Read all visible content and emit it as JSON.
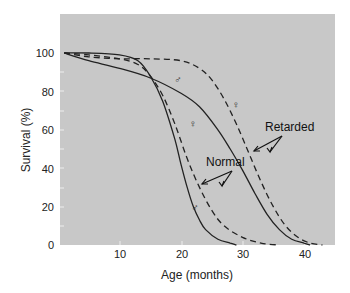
{
  "chart_data": {
    "type": "line",
    "title": "",
    "xlabel": "Age (months)",
    "ylabel": "Survival (%)",
    "xlim": [
      0,
      45
    ],
    "ylim": [
      0,
      120
    ],
    "xticks": [
      10,
      20,
      30,
      40
    ],
    "yticks": [
      0,
      20,
      40,
      60,
      80,
      100
    ],
    "grid": false,
    "background": "#c8c8c8",
    "series": [
      {
        "name": "Normal ♂",
        "group": "Normal",
        "sex": "male",
        "style": "solid",
        "x": [
          1,
          5,
          10,
          13,
          15,
          17,
          19,
          20,
          21,
          22,
          23,
          24,
          26,
          28,
          29
        ],
        "y": [
          100,
          100,
          99,
          96,
          88,
          75,
          55,
          42,
          30,
          20,
          13,
          8,
          3,
          1,
          0
        ]
      },
      {
        "name": "Normal ♀",
        "group": "Normal",
        "sex": "female",
        "style": "dashed",
        "x": [
          1,
          5,
          10,
          13,
          15,
          17,
          19,
          21,
          23,
          25,
          27,
          30,
          33,
          36
        ],
        "y": [
          100,
          99,
          97,
          94,
          88,
          78,
          63,
          45,
          30,
          18,
          10,
          4,
          1,
          0
        ]
      },
      {
        "name": "Retarded ♂",
        "group": "Retarded",
        "sex": "male",
        "style": "solid",
        "x": [
          1,
          5,
          10,
          15,
          20,
          23,
          26,
          28,
          30,
          32,
          34,
          36,
          38,
          40,
          41
        ],
        "y": [
          100,
          96,
          92,
          87,
          79,
          72,
          60,
          50,
          39,
          27,
          16,
          8,
          3,
          1,
          0
        ]
      },
      {
        "name": "Retarded ♀",
        "group": "Retarded",
        "sex": "female",
        "style": "dashed",
        "x": [
          1,
          5,
          10,
          15,
          20,
          23,
          25,
          27,
          29,
          31,
          33,
          35,
          37,
          39,
          41,
          43
        ],
        "y": [
          100,
          98,
          97,
          97,
          96,
          92,
          86,
          76,
          63,
          48,
          33,
          20,
          10,
          4,
          1,
          0
        ]
      }
    ],
    "annotations": [
      {
        "text": "Normal",
        "x": 23,
        "y": 41
      },
      {
        "text": "Retarded",
        "x": 35.5,
        "y": 62
      }
    ]
  },
  "labels": {
    "xlabel": "Age (months)",
    "ylabel": "Survival (%)",
    "normal": "Normal",
    "retarded": "Retarded",
    "male": "♂",
    "female": "♀",
    "yticks": [
      "0",
      "20",
      "40",
      "60",
      "80",
      "100"
    ],
    "xticks": [
      "10",
      "20",
      "30",
      "40"
    ]
  }
}
